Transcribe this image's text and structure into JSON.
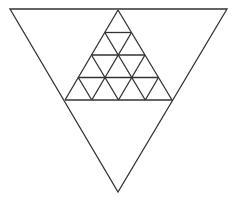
{
  "diagram": {
    "title": "",
    "stroke_color": "#333333",
    "background": "#ffffff",
    "outer_triangle": {
      "orientation": "inverted",
      "vertices": [
        [
          10,
          9
        ],
        [
          227,
          9
        ],
        [
          118,
          192
        ]
      ]
    },
    "inner_triangle": {
      "orientation": "upright",
      "subdivisions": 4,
      "apex": [
        118,
        10
      ],
      "base_left": [
        65,
        100
      ],
      "base_right": [
        172,
        100
      ],
      "small_triangle_count": 16
    }
  }
}
